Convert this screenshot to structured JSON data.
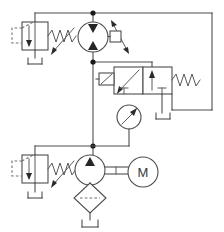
{
  "diagram": {
    "type": "hydraulic-schematic",
    "background_color": "#ffffff",
    "line_color": "#4d4d4d",
    "junction_color": "#1a1a1a"
  },
  "components": {
    "hydraulic_motor": {
      "name": "bidirectional variable displacement hydraulic motor",
      "label": "",
      "center_x": 93,
      "center_y": 37,
      "radius": 15,
      "variable_arrow": true,
      "port_triangles": 2
    },
    "relief_valve_top": {
      "name": "pilot operated pressure relief valve (top)",
      "label": "",
      "x": 22,
      "y": 22,
      "width": 26,
      "height": 28,
      "has_spring": true,
      "has_pilot_line": true,
      "has_drain_to_tank": true
    },
    "relief_valve_bottom": {
      "name": "pilot operated pressure relief valve (bottom)",
      "label": "",
      "x": 22,
      "y": 155,
      "width": 26,
      "height": 28,
      "has_spring": true,
      "has_pilot_line": true,
      "has_drain_to_tank": true
    },
    "directional_valve": {
      "name": "2-position 4-way solenoid directional control valve",
      "label": "",
      "x": 114,
      "y": 67,
      "width": 58,
      "height": 27,
      "positions": 2,
      "actuator_left": "solenoid",
      "actuator_right": "spring return"
    },
    "pressure_gauge": {
      "name": "pressure gauge",
      "label": "",
      "center_x": 129,
      "center_y": 117,
      "radius": 12
    },
    "pump": {
      "name": "fixed displacement hydraulic pump",
      "label": "",
      "center_x": 90,
      "center_y": 170,
      "radius": 15
    },
    "electric_motor": {
      "name": "electric drive motor",
      "label": "M",
      "center_x": 143,
      "center_y": 172,
      "radius": 15
    },
    "filter": {
      "name": "suction filter / strainer",
      "label": "",
      "center_x": 90,
      "center_y": 198,
      "half_width": 16,
      "half_height": 15
    },
    "reservoir_pump": {
      "name": "reservoir tank (pump suction)",
      "label": ""
    },
    "reservoir_relief_top": {
      "name": "reservoir tank (top relief valve drain)",
      "label": ""
    },
    "reservoir_relief_bottom": {
      "name": "reservoir tank (bottom relief valve drain)",
      "label": ""
    },
    "reservoir_valve": {
      "name": "reservoir tank (directional valve return)",
      "label": ""
    }
  },
  "junctions": [
    {
      "name": "top-pressure-junction",
      "x": 93,
      "y": 13
    },
    {
      "name": "mid-pressure-junction",
      "x": 93,
      "y": 62
    },
    {
      "name": "pump-outlet-junction",
      "x": 93,
      "y": 146
    }
  ],
  "lines": {
    "top_rail": "from top-left relief valve to right return rail",
    "main_vertical": "pump outlet up through valve tap to motor inlet",
    "right_return": "valve tank port up and across top rail"
  }
}
